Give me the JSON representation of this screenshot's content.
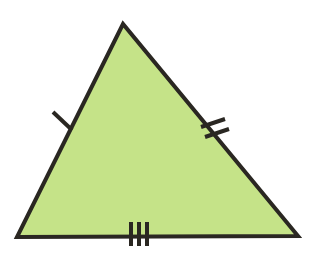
{
  "figure": {
    "type": "triangle",
    "name": "equilateral-triangle-with-congruence-ticks",
    "background_color": "#ffffff",
    "fill_color": "#c5e388",
    "outline_color": "#2a2722",
    "outline_width": 4,
    "canvas": {
      "width": 311,
      "height": 256
    },
    "vertices": [
      {
        "label": "apex",
        "x": 123,
        "y": 24
      },
      {
        "label": "bottom-left",
        "x": 17,
        "y": 237
      },
      {
        "label": "bottom-right",
        "x": 298,
        "y": 236
      }
    ],
    "edges": [
      {
        "name": "left-edge",
        "from": "apex",
        "to": "bottom-left",
        "tick_count": 1
      },
      {
        "name": "right-edge",
        "from": "apex",
        "to": "bottom-right",
        "tick_count": 2
      },
      {
        "name": "bottom-edge",
        "from": "bottom-left",
        "to": "bottom-right",
        "tick_count": 3
      }
    ],
    "tick_marks": {
      "color": "#2a2722",
      "width": 4,
      "left": [
        {
          "x1": 53,
          "y1": 112,
          "x2": 72,
          "y2": 130
        }
      ],
      "right": [
        {
          "x1": 201,
          "y1": 127,
          "x2": 225,
          "y2": 119
        },
        {
          "x1": 205,
          "y1": 137,
          "x2": 229,
          "y2": 129
        }
      ],
      "bottom": [
        {
          "x1": 131,
          "y1": 222,
          "x2": 131,
          "y2": 246
        },
        {
          "x1": 139,
          "y1": 222,
          "x2": 139,
          "y2": 246
        },
        {
          "x1": 147,
          "y1": 222,
          "x2": 147,
          "y2": 246
        }
      ]
    }
  }
}
